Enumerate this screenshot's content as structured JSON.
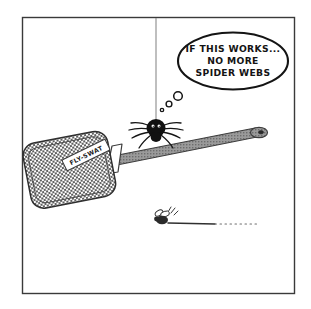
{
  "panel": {
    "title": "Spider on flyswatter cartoon",
    "background_color": "#ffffff",
    "frame_color": "#3a3a3a",
    "ink_color": "#1a1a1a"
  },
  "speech_bubble": {
    "type": "thought-bubble",
    "lines": [
      "IF THIS WORKS...",
      "NO MORE",
      "SPIDER WEBS"
    ],
    "full_text": "IF THIS WORKS... NO MORE SPIDER WEBS",
    "trail_dot_count": 3
  },
  "characters": {
    "spider": {
      "name": "spider",
      "leg_count": 8,
      "body_color": "#111111",
      "hanging_from": "ceiling thread"
    },
    "fly": {
      "name": "fly",
      "body_color": "#2b2b2b",
      "motion_lines": 3,
      "trajectory": "horizontal dashed trail"
    }
  },
  "objects": {
    "flyswatter": {
      "name": "flyswatter",
      "label": "FLY-SWAT",
      "mesh_color": "#6e6e6e",
      "handle_color": "#8a8a8a",
      "orientation": "diagonal, pad at lower-left"
    },
    "thread": {
      "name": "spider-thread",
      "color": "#7a7a7a"
    }
  }
}
